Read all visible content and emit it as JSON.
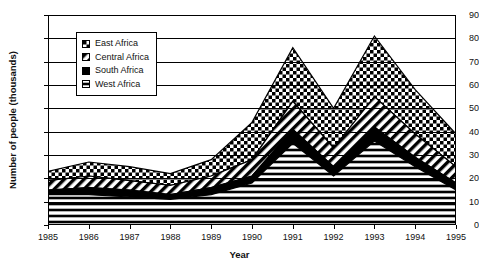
{
  "chart_data": {
    "type": "area",
    "stacked": true,
    "title": "",
    "xlabel": "Year",
    "ylabel": "Number of people (thousands)",
    "x": [
      1985,
      1986,
      1987,
      1988,
      1989,
      1990,
      1991,
      1992,
      1993,
      1994,
      1995
    ],
    "xticklabels": [
      "1985",
      "1986",
      "1987",
      "1988",
      "1989",
      "1990",
      "1991",
      "1992",
      "1993",
      "1994",
      "1995"
    ],
    "yticklabels": [
      "0",
      "10",
      "20",
      "30",
      "40",
      "50",
      "60",
      "70",
      "80",
      "90"
    ],
    "ylim": [
      0,
      90
    ],
    "ytick_step": 10,
    "grid": true,
    "legend_position": "upper-left-inside",
    "series": [
      {
        "name": "West Africa",
        "pattern": "horizontal-lines",
        "values": [
          13,
          13,
          12,
          11,
          13,
          18,
          35,
          21,
          36,
          25,
          15
        ]
      },
      {
        "name": "South Africa",
        "pattern": "solid-black",
        "values": [
          15,
          16,
          15,
          13,
          16,
          21,
          41,
          25,
          42,
          29,
          18
        ]
      },
      {
        "name": "Central Africa",
        "pattern": "diagonal-hatch",
        "values": [
          19,
          21,
          19,
          17,
          21,
          28,
          53,
          33,
          55,
          39,
          25
        ]
      },
      {
        "name": "East Africa",
        "pattern": "checkerboard",
        "values": [
          23,
          27,
          25,
          22,
          28,
          44,
          76,
          50,
          81,
          58,
          39
        ]
      }
    ],
    "legend": [
      {
        "label": "East Africa",
        "pattern": "checkerboard"
      },
      {
        "label": "Central Africa",
        "pattern": "diagonal-hatch"
      },
      {
        "label": "South Africa",
        "pattern": "solid-black"
      },
      {
        "label": "West Africa",
        "pattern": "horizontal-lines"
      }
    ],
    "colors": {
      "ink": "#000000",
      "background": "#ffffff",
      "grid": "#000000"
    }
  }
}
